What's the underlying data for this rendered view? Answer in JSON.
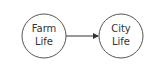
{
  "diagram": {
    "nodes": [
      {
        "id": "farm",
        "line1": "Farm",
        "line2": "Life"
      },
      {
        "id": "city",
        "line1": "City",
        "line2": "Life"
      }
    ],
    "edges": [
      {
        "from": "farm",
        "to": "city"
      }
    ],
    "colors": {
      "stroke": "#333333",
      "background": "#ffffff"
    }
  }
}
